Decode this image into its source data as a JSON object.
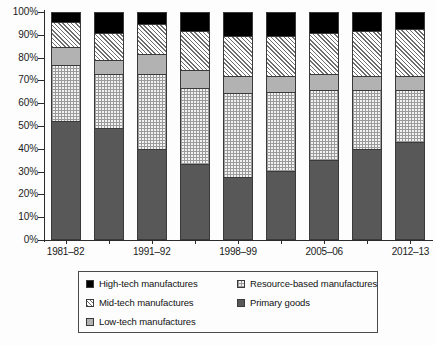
{
  "chart_data": {
    "type": "bar",
    "subtype": "stacked-percentage",
    "title": "",
    "xlabel": "",
    "ylabel": "",
    "ylim": [
      0,
      100
    ],
    "yticks": [
      "0%",
      "10%",
      "20%",
      "30%",
      "40%",
      "50%",
      "60%",
      "70%",
      "80%",
      "90%",
      "100%"
    ],
    "grid": false,
    "legend_position": "bottom",
    "categories": [
      "1981–82",
      "1985–86",
      "1991–92",
      "1995–96",
      "1998–99",
      "2002–03",
      "2005–06",
      "2009–10",
      "2012–13"
    ],
    "tick_labels": [
      "1981–82",
      "1991–92",
      "1998–99",
      "2005–06",
      "2012–13"
    ],
    "tick_label_indices": [
      0,
      2,
      4,
      6,
      8
    ],
    "series": [
      {
        "name": "Primary goods",
        "pattern": "solid-dark-grey",
        "color": "#585858",
        "values": [
          52,
          49,
          40,
          33,
          27.5,
          30,
          35,
          40,
          43
        ]
      },
      {
        "name": "Resource-based manufactures",
        "pattern": "fine-dot",
        "color": "#f2f2f2",
        "values": [
          25,
          24,
          33,
          34,
          37,
          35,
          31,
          26,
          23
        ]
      },
      {
        "name": "Low-tech manufactures",
        "pattern": "flat-grey",
        "color": "#b2b2b2",
        "values": [
          8,
          6,
          9,
          8,
          7.5,
          7,
          7,
          6,
          6
        ]
      },
      {
        "name": "Mid-tech manufactures",
        "pattern": "diagonal-hatch",
        "color": "#ffffff",
        "values": [
          11,
          12,
          13,
          17,
          18,
          18,
          18,
          20,
          21
        ]
      },
      {
        "name": "High-tech manufactures",
        "pattern": "solid-black",
        "color": "#000000",
        "values": [
          4,
          9,
          5,
          8,
          10,
          10,
          9,
          8,
          7
        ]
      }
    ]
  },
  "legend": {
    "items": [
      {
        "label": "High-tech manufactures",
        "swatch": "solid-black",
        "col": 0,
        "row": 0
      },
      {
        "label": "Mid-tech manufactures",
        "swatch": "diagonal-hatch",
        "col": 0,
        "row": 1
      },
      {
        "label": "Low-tech manufactures",
        "swatch": "flat-grey",
        "col": 0,
        "row": 2
      },
      {
        "label": "Resource-based manufactures",
        "swatch": "fine-dot",
        "col": 1,
        "row": 0
      },
      {
        "label": "Primary goods",
        "swatch": "solid-dark-grey",
        "col": 1,
        "row": 1
      }
    ]
  }
}
